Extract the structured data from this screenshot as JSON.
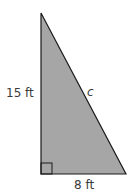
{
  "diagram": {
    "shape": "right-triangle",
    "fill_color": "#a6a6a6",
    "stroke_color": "#1a1a1a",
    "labels": {
      "vertical_leg": "15 ft",
      "horizontal_leg": "8 ft",
      "hypotenuse": "c"
    },
    "right_angle_marker": true
  }
}
